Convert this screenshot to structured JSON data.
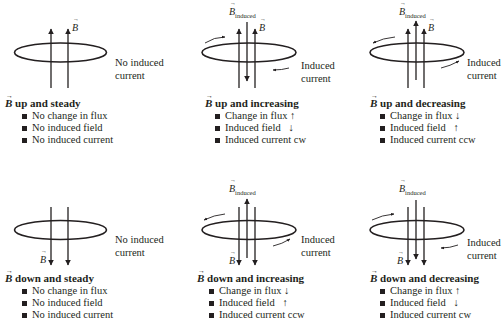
{
  "figure": {
    "symbol_field": "B",
    "symbol_induced_subscript": "induced",
    "panels": [
      {
        "id": "up-steady",
        "title_rest": " up and steady",
        "side_label_line1": "No induced",
        "side_label_line2": "current",
        "bullets": [
          "No change in flux",
          "No induced field",
          "No induced current"
        ],
        "field_direction": "up",
        "induced_field": "none",
        "induced_current": "none"
      },
      {
        "id": "up-increasing",
        "title_rest": " up and increasing",
        "side_label_line1": "Induced",
        "side_label_line2": "current",
        "bullets": [
          "Change in flux ↑",
          "Induced field   ↓",
          "Induced current cw"
        ],
        "field_direction": "up",
        "induced_field": "down",
        "induced_current": "cw"
      },
      {
        "id": "up-decreasing",
        "title_rest": " up and decreasing",
        "side_label_line1": "Induced",
        "side_label_line2": "current",
        "bullets": [
          "Change in flux ↓",
          "Induced field   ↑",
          "Induced current ccw"
        ],
        "field_direction": "up",
        "induced_field": "up",
        "induced_current": "ccw"
      },
      {
        "id": "down-steady",
        "title_rest": " down and steady",
        "side_label_line1": "No induced",
        "side_label_line2": "current",
        "bullets": [
          "No change in flux",
          "No induced field",
          "No induced current"
        ],
        "field_direction": "down",
        "induced_field": "none",
        "induced_current": "none"
      },
      {
        "id": "down-increasing",
        "title_rest": " down and increasing",
        "side_label_line1": "Induced",
        "side_label_line2": "current",
        "bullets": [
          "Change in flux ↓",
          "Induced field   ↑",
          "Induced current ccw"
        ],
        "field_direction": "down",
        "induced_field": "up",
        "induced_current": "ccw"
      },
      {
        "id": "down-decreasing",
        "title_rest": " down and decreasing",
        "side_label_line1": "Induced",
        "side_label_line2": "current",
        "bullets": [
          "Change in flux ↑",
          "Induced field   ↓",
          "Induced current cw"
        ],
        "field_direction": "down",
        "induced_field": "down",
        "induced_current": "cw"
      }
    ],
    "colors": {
      "ink": "#231f20",
      "background": "#ffffff"
    }
  }
}
